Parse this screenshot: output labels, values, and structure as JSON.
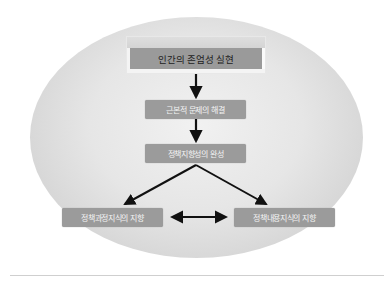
{
  "diagram": {
    "top": {
      "label": "인간의 존엄성 실현"
    },
    "level2": {
      "label": "근본적 문제의 해결"
    },
    "level3": {
      "label": "정책지향성의 완성"
    },
    "left": {
      "label": "정책과정지식의 지향"
    },
    "right": {
      "label": "정책내용지식의 지향"
    }
  },
  "colors": {
    "box_fill": "#9b9b9b",
    "box_text": "#f4f4f4",
    "top_text": "#222222",
    "arrow": "#111111",
    "ellipse_edge": "#c9c9c9",
    "ellipse_center": "#f1f1f1"
  },
  "connections": [
    {
      "from": "top",
      "to": "level2",
      "type": "arrow"
    },
    {
      "from": "level2",
      "to": "level3",
      "type": "arrow"
    },
    {
      "from": "level3",
      "to": "left",
      "type": "arrow"
    },
    {
      "from": "level3",
      "to": "right",
      "type": "arrow"
    },
    {
      "from": "left",
      "to": "right",
      "type": "double-arrow"
    }
  ]
}
